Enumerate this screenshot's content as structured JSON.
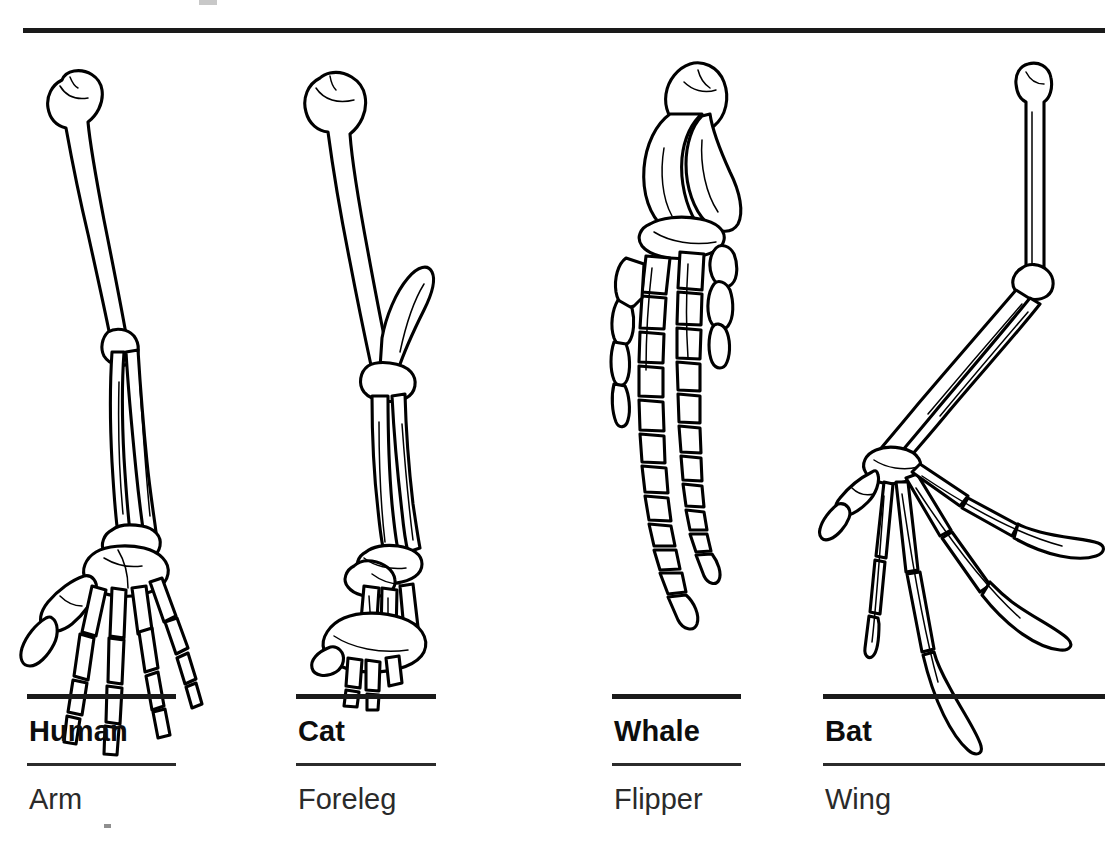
{
  "figure": {
    "top_rule_color": "#1a1a1a",
    "line_art_color": "#000000",
    "background_color": "#ffffff"
  },
  "columns": [
    {
      "id": "human",
      "name": "Human",
      "part": "Arm",
      "illustration": "human-arm-skeleton",
      "bones": [
        "humerus",
        "radius",
        "ulna",
        "carpals",
        "metacarpals",
        "phalanges"
      ],
      "digit_count": 5
    },
    {
      "id": "cat",
      "name": "Cat",
      "part": "Foreleg",
      "illustration": "cat-foreleg-skeleton",
      "bones": [
        "humerus",
        "radius",
        "ulna",
        "carpals",
        "metacarpals",
        "phalanges"
      ],
      "digit_count": 5
    },
    {
      "id": "whale",
      "name": "Whale",
      "part": "Flipper",
      "illustration": "whale-flipper-skeleton",
      "bones": [
        "humerus",
        "radius",
        "ulna",
        "carpals",
        "metacarpals",
        "phalanges"
      ],
      "digit_count": 4
    },
    {
      "id": "bat",
      "name": "Bat",
      "part": "Wing",
      "illustration": "bat-wing-skeleton",
      "bones": [
        "humerus",
        "radius",
        "ulna",
        "carpals",
        "metacarpals",
        "phalanges"
      ],
      "digit_count": 5
    }
  ]
}
